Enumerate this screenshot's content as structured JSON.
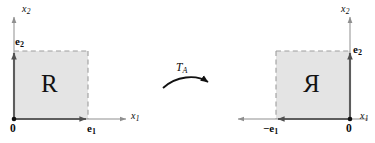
{
  "figure": {
    "caption_text": "",
    "colors": {
      "fill": "#e2e2e2",
      "solid_edge": "#5a5a5a",
      "dashed_edge": "#9a9a9a",
      "axis": "#8f8f8f",
      "text": "#0b0b0b",
      "background": "#ffffff"
    },
    "left_panel": {
      "name": "domain-panel",
      "axis_x_label": "x",
      "axis_x_sub": "1",
      "axis_y_label": "x",
      "axis_y_sub": "2",
      "origin_label": "0",
      "basis_x_label": "e",
      "basis_x_sub": "1",
      "basis_y_label": "e",
      "basis_y_sub": "2",
      "region_label": "R",
      "region_mirrored": false
    },
    "map": {
      "name": "transformation-arrow",
      "label": "T",
      "label_sub": "A",
      "direction": "left-to-right"
    },
    "right_panel": {
      "name": "image-panel",
      "axis_x_label": "x",
      "axis_x_sub": "1",
      "axis_y_label": "x",
      "axis_y_sub": "2",
      "origin_label": "0",
      "basis_x_label": "−e",
      "basis_x_sub": "1",
      "basis_y_label": "e",
      "basis_y_sub": "2",
      "region_label": "R",
      "region_mirrored": true
    }
  }
}
